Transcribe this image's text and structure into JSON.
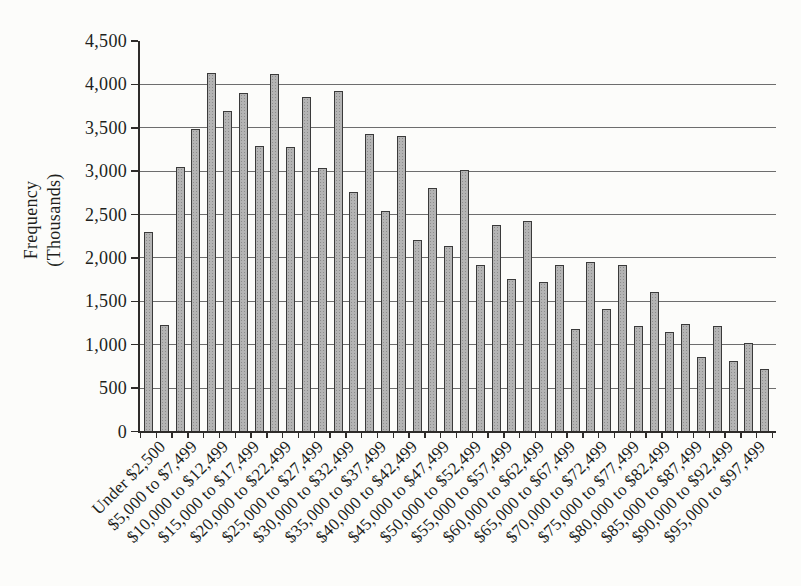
{
  "figure": {
    "background": "#fcfcfa",
    "text_color": "#211f1c",
    "axis_color": "#2e2c2a",
    "grid_color": "#6d6d6d",
    "bar_fill": "#b4b4b4",
    "bar_dot": "#8d8d8d",
    "bar_border": "#3a3a3a"
  },
  "chart_data": {
    "type": "bar",
    "title": "",
    "xlabel": "",
    "ylabel": "Frequency (Thousands)",
    "ylabel_lines": [
      "Frequency",
      "(Thousands)"
    ],
    "ylim": [
      0,
      4500
    ],
    "ytick_step": 500,
    "ytick_labels": [
      "0",
      "500",
      "1,000",
      "1,500",
      "2,000",
      "2,500",
      "3,000",
      "3,500",
      "4,000",
      "4,500"
    ],
    "grid": "horizontal-only, every 500, none at 4500",
    "legend": "none",
    "bars": [
      {
        "label": "Under $2,500",
        "value": 2300
      },
      {
        "label": "",
        "value": 1230
      },
      {
        "label": "$5,000 to $7,499",
        "value": 3050
      },
      {
        "label": "",
        "value": 3490
      },
      {
        "label": "$10,000 to $12,499",
        "value": 4140
      },
      {
        "label": "",
        "value": 3700
      },
      {
        "label": "$15,000 to $17,499",
        "value": 3910
      },
      {
        "label": "",
        "value": 3300
      },
      {
        "label": "$20,000 to $22,499",
        "value": 4120
      },
      {
        "label": "",
        "value": 3290
      },
      {
        "label": "$25,000 to $27,499",
        "value": 3860
      },
      {
        "label": "",
        "value": 3040
      },
      {
        "label": "$30,000 to $32,499",
        "value": 3930
      },
      {
        "label": "",
        "value": 2760
      },
      {
        "label": "$35,000 to $37,499",
        "value": 3430
      },
      {
        "label": "",
        "value": 2550
      },
      {
        "label": "$40,000 to $42,499",
        "value": 3410
      },
      {
        "label": "",
        "value": 2210
      },
      {
        "label": "$45,000 to $47,499",
        "value": 2810
      },
      {
        "label": "",
        "value": 2140
      },
      {
        "label": "$50,000 to $52,499",
        "value": 3020
      },
      {
        "label": "",
        "value": 1930
      },
      {
        "label": "$55,000 to $57,499",
        "value": 2380
      },
      {
        "label": "",
        "value": 1760
      },
      {
        "label": "$60,000 to $62,499",
        "value": 2430
      },
      {
        "label": "",
        "value": 1730
      },
      {
        "label": "$65,000 to $67,499",
        "value": 1930
      },
      {
        "label": "",
        "value": 1190
      },
      {
        "label": "$70,000 to $72,499",
        "value": 1960
      },
      {
        "label": "",
        "value": 1420
      },
      {
        "label": "$75,000 to $77,499",
        "value": 1930
      },
      {
        "label": "",
        "value": 1220
      },
      {
        "label": "$80,000 to $82,499",
        "value": 1610
      },
      {
        "label": "",
        "value": 1150
      },
      {
        "label": "$85,000 to $87,499",
        "value": 1250
      },
      {
        "label": "",
        "value": 860
      },
      {
        "label": "$90,000 to $92,499",
        "value": 1220
      },
      {
        "label": "",
        "value": 820
      },
      {
        "label": "$95,000 to $97,499",
        "value": 1020
      },
      {
        "label": "",
        "value": 730
      }
    ]
  }
}
